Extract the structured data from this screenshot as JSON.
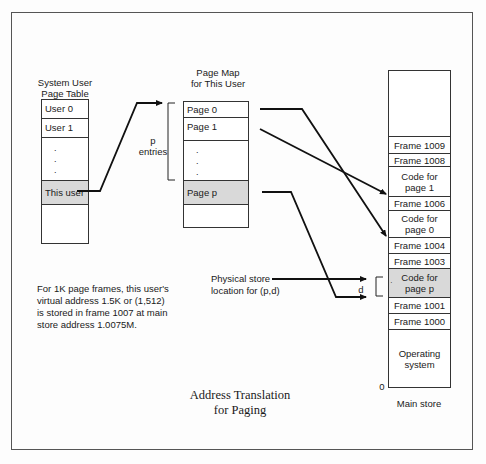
{
  "figure": {
    "title_line1": "Address Translation",
    "title_line2": "for Paging"
  },
  "user_table": {
    "header_line1": "System User",
    "header_line2": "Page Table",
    "rows": [
      "User 0",
      "User 1",
      "·",
      "This user",
      ""
    ],
    "dots": [
      ".",
      ".",
      "."
    ]
  },
  "page_map": {
    "header_line1": "Page Map",
    "header_line2": "for This User",
    "rows": [
      "Page 0",
      "Page 1",
      "",
      "Page p",
      ""
    ],
    "dots": [
      ".",
      ".",
      "."
    ],
    "bracket_label_line1": "p",
    "bracket_label_line2": "entries"
  },
  "main_store": {
    "label": "Main store",
    "zero_label": "0",
    "rows": [
      {
        "text": "",
        "shaded": false
      },
      {
        "text": "Frame 1009",
        "shaded": false
      },
      {
        "text": "Frame 1008",
        "shaded": false
      },
      {
        "text": "Code for page 1",
        "line1": "Code for",
        "line2": "page 1",
        "shaded": false
      },
      {
        "text": "Frame 1006",
        "shaded": false
      },
      {
        "text": "Code for page 0",
        "line1": "Code for",
        "line2": "page 0",
        "shaded": false
      },
      {
        "text": "Frame 1004",
        "shaded": false
      },
      {
        "text": "Frame 1003",
        "shaded": false
      },
      {
        "text": "Code for page p",
        "line1": "Code for",
        "line2": "page p",
        "shaded": true
      },
      {
        "text": "Frame 1001",
        "shaded": false
      },
      {
        "text": "Frame 1000",
        "shaded": false
      },
      {
        "text": "Operating system",
        "line1": "Operating",
        "line2": "system",
        "shaded": false
      }
    ]
  },
  "physical_store": {
    "label_line1": "Physical store",
    "label_line2": "location for (p,d)",
    "offset_label": "d"
  },
  "note": {
    "line1": "For 1K page frames, this user's",
    "line2": "virtual address 1.5K or (1,512)",
    "line3": "is stored in frame 1007 at main",
    "line4": "store address 1.0075M."
  }
}
